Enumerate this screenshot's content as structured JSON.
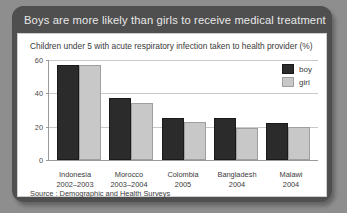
{
  "header": {
    "title": "Boys are more likely than girls to receive medical treatment"
  },
  "panel": {
    "subtitle": "Children under 5 with acute respiratory infection taken to health provider (%)",
    "source": "Source : Demographic and Health Surveys"
  },
  "legend": {
    "position": "top-right",
    "items": [
      {
        "label": "boy",
        "color": "#2b2b2b"
      },
      {
        "label": "girl",
        "color": "#c8c8c8"
      }
    ]
  },
  "colors": {
    "background": "#8e8e8e",
    "card": "#4f4f4f",
    "panel": "#ffffff",
    "boy": "#2b2b2b",
    "girl": "#c8c8c8",
    "grid": "#c9c9c9",
    "axis": "#9a9a9a"
  },
  "axis": {
    "yticks": [
      60,
      40,
      20,
      0
    ],
    "ymax": 60,
    "ymin": 0
  },
  "chart_data": {
    "type": "bar",
    "title": "Boys are more likely than girls to receive medical treatment",
    "subtitle": "Children under 5 with acute respiratory infection taken to health provider (%)",
    "xlabel": "",
    "ylabel": "",
    "ylim": [
      0,
      60
    ],
    "yticks": [
      0,
      20,
      40,
      60
    ],
    "grid": true,
    "legend_position": "top-right",
    "categories": [
      "Indonesia",
      "Morocco",
      "Colombia",
      "Bangladesh",
      "Malawi"
    ],
    "category_years": [
      "2002–2003",
      "2003–2004",
      "2005",
      "2004",
      "2004"
    ],
    "series": [
      {
        "name": "boy",
        "color": "#2b2b2b",
        "values": [
          57,
          37,
          25,
          25,
          22
        ]
      },
      {
        "name": "girl",
        "color": "#c8c8c8",
        "values": [
          57,
          34,
          23,
          19,
          20
        ]
      }
    ],
    "source": "Source : Demographic and Health Surveys"
  }
}
